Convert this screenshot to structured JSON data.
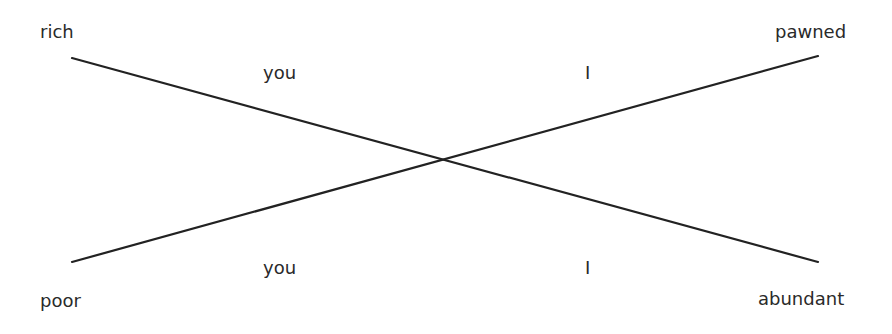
{
  "diagram": {
    "type": "crossing-lines",
    "line_color": "#222222",
    "corners": {
      "top_left": "rich",
      "top_right": "pawned",
      "bottom_left": "poor",
      "bottom_right": "abundant"
    },
    "mid_labels": {
      "top_left": "you",
      "top_right": "I",
      "bottom_left": "you",
      "bottom_right": "I"
    },
    "lines": [
      {
        "from": "rich",
        "to": "abundant",
        "x1": 72,
        "y1": 58,
        "x2": 818,
        "y2": 262
      },
      {
        "from": "poor",
        "to": "pawned",
        "x1": 72,
        "y1": 262,
        "x2": 818,
        "y2": 56
      }
    ]
  }
}
